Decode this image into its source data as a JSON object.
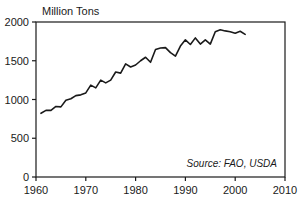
{
  "chart_data": {
    "type": "line",
    "title": "Million Tons",
    "xlabel": "",
    "ylabel": "Million Tons",
    "xlim": [
      1960,
      2010
    ],
    "ylim": [
      0,
      2000
    ],
    "grid": false,
    "legend": null,
    "line_color": "#1a1a1a",
    "annotations": [
      {
        "name": "source-note",
        "text": "Source: FAO, USDA",
        "position": "bottom-right-inside"
      }
    ],
    "xticks": [
      1960,
      1970,
      1980,
      1990,
      2000,
      2010
    ],
    "xtick_labels": [
      "1960",
      "1970",
      "1980",
      "1990",
      "2000",
      "2010"
    ],
    "yticks": [
      0,
      500,
      1000,
      1500,
      2000
    ],
    "ytick_labels": [
      "0",
      "500",
      "1000",
      "1500",
      "2000"
    ],
    "series": [
      {
        "name": "World Grain Production",
        "x": [
          1961,
          1962,
          1963,
          1964,
          1965,
          1966,
          1967,
          1968,
          1969,
          1970,
          1971,
          1972,
          1973,
          1974,
          1975,
          1976,
          1977,
          1978,
          1979,
          1980,
          1981,
          1982,
          1983,
          1984,
          1985,
          1986,
          1987,
          1988,
          1989,
          1990,
          1991,
          1992,
          1993,
          1994,
          1995,
          1996,
          1997,
          1998,
          1999,
          2000,
          2001,
          2002
        ],
        "values": [
          822,
          860,
          860,
          910,
          905,
          990,
          1010,
          1050,
          1060,
          1085,
          1185,
          1150,
          1250,
          1215,
          1250,
          1355,
          1340,
          1460,
          1420,
          1445,
          1500,
          1545,
          1480,
          1645,
          1665,
          1670,
          1605,
          1560,
          1690,
          1770,
          1710,
          1795,
          1715,
          1770,
          1715,
          1875,
          1900,
          1885,
          1875,
          1855,
          1880,
          1840
        ]
      }
    ]
  },
  "chart_labels": {
    "y_axis_caption": "Million Tons",
    "source": "Source: FAO, USDA"
  }
}
